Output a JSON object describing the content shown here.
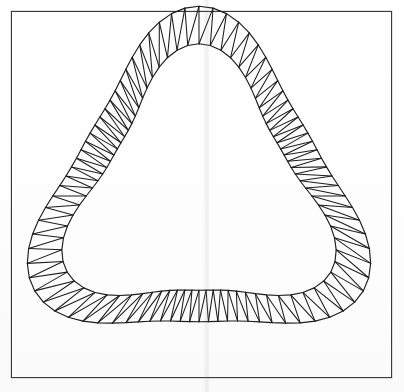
{
  "figure": {
    "kind": "geometric-line-drawing",
    "background_color": "#fdfdfd",
    "stroke_color": "#1d1d1d",
    "frame_color": "#3a3a3a",
    "canvas": {
      "width": 404,
      "height": 392
    },
    "frame": {
      "x": 11,
      "y": 11,
      "width": 381,
      "height": 367,
      "border_px": 1
    },
    "artifacts": [
      {
        "name": "vertical-scan-seam",
        "x": 203,
        "width": 7,
        "opacity": 0.14
      }
    ]
  },
  "chart_data": {
    "type": "line",
    "xlabel": "",
    "ylabel": "",
    "grid": false,
    "legend": "none",
    "xlim": [
      11,
      392
    ],
    "ylim": [
      11,
      378
    ],
    "geometry": {
      "description": "Two concentric 3-lobed (trefoil) closed curves forming an annular band, subdivided into a triangle strip mesh.",
      "center": {
        "x": 199,
        "y": 196
      },
      "lobes": 3,
      "lobe_phase_deg": -90,
      "outer_curve": {
        "name": "outer-boundary",
        "mean_radius": 152,
        "lobe_amplitude": 32,
        "extremes": {
          "top_peak": {
            "x": 285,
            "y": 28
          },
          "left_peak": {
            "x": 28,
            "y": 178
          },
          "bottom_peak": {
            "x": 252,
            "y": 363
          },
          "rightmost": {
            "x": 365,
            "y": 132
          }
        }
      },
      "inner_curve": {
        "name": "inner-boundary",
        "mean_radius": 118,
        "lobe_amplitude": 29
      },
      "band_width_range": [
        22,
        40
      ],
      "triangulation": {
        "segments": 84,
        "pattern": "alternating-diagonal triangle strip",
        "radial_rungs": 84,
        "diagonals": 84,
        "triangles": 168
      },
      "stroke_width": 1.15
    }
  }
}
